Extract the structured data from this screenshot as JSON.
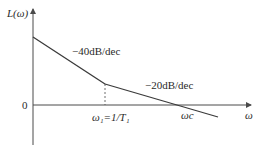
{
  "diagram": {
    "y_axis_label": "L(ω)",
    "x_axis_label": "ω",
    "origin_label": "0",
    "segments": [
      {
        "name": "low-frequency",
        "slope_label": "−40dB/dec"
      },
      {
        "name": "high-frequency",
        "slope_label": "−20dB/dec"
      }
    ],
    "breakpoint_label": "ω₁=1/T₁",
    "crossover_label": "ωc"
  }
}
